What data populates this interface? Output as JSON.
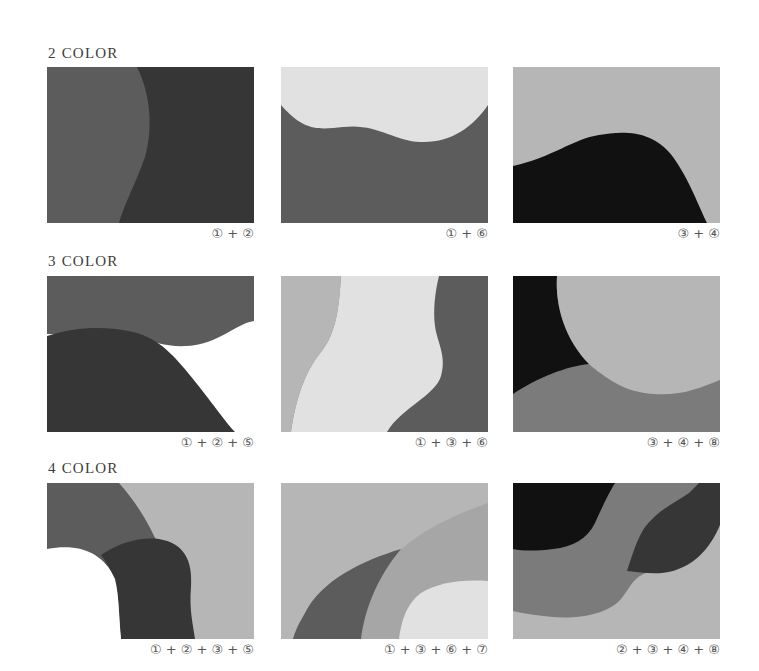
{
  "colors": {
    "1": "#5c5c5c",
    "2": "#363636",
    "3": "#b6b6b6",
    "4": "#111111",
    "5": "#ffffff",
    "6": "#e1e1e1",
    "7": "#e8e8e8",
    "8": "#7b7b7b",
    "3b": "#a6a6a6"
  },
  "sections": [
    {
      "heading": "2 COLOR",
      "swatches": [
        {
          "label": "① + ②"
        },
        {
          "label": "① + ⑥"
        },
        {
          "label": "③ + ④"
        }
      ]
    },
    {
      "heading": "3 COLOR",
      "swatches": [
        {
          "label": "① + ② + ⑤"
        },
        {
          "label": "① + ③ + ⑥"
        },
        {
          "label": "③ + ④ + ⑧"
        }
      ]
    },
    {
      "heading": "4 COLOR",
      "swatches": [
        {
          "label": "① + ② + ③ + ⑤"
        },
        {
          "label": "① + ③ + ⑥ + ⑦"
        },
        {
          "label": "② + ③ + ④ + ⑧"
        }
      ]
    }
  ]
}
